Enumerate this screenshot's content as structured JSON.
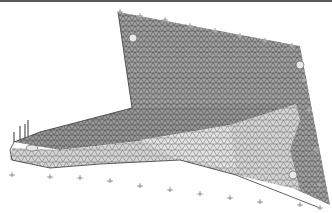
{
  "figure": {
    "title": "Finite element triangular mesh of bracket with boundary constraints",
    "background": "#ffffff",
    "border_color": "#5a5a5a",
    "mesh": {
      "element_type": "triangle",
      "line_color": "#3c3c3c",
      "face_color_dark": "#9a9a9a",
      "face_color_light": "#d8d8d8"
    },
    "parts": [
      {
        "name": "back-plate",
        "points": "118,12 300,46 330,205 236,160 132,110"
      },
      {
        "name": "horizontal-flange",
        "points": "132,110 236,160 300,185 170,170 60,150 10,150 12,135"
      },
      {
        "name": "gusset",
        "points": "12,135 132,110 290,95 300,120 180,160 60,170 10,160"
      }
    ],
    "holes": [
      {
        "name": "hole-top-left",
        "cx": 133,
        "cy": 38,
        "r": 4
      },
      {
        "name": "hole-top-right",
        "cx": 300,
        "cy": 65,
        "r": 4
      },
      {
        "name": "hole-bottom-right",
        "cx": 293,
        "cy": 175,
        "r": 4
      },
      {
        "name": "hole-tip",
        "cx": 32,
        "cy": 153,
        "r": 4
      }
    ],
    "constraints": {
      "color": "#a8a8a8",
      "markers": [
        [
          120,
          12
        ],
        [
          140,
          16
        ],
        [
          165,
          20
        ],
        [
          190,
          26
        ],
        [
          215,
          31
        ],
        [
          240,
          36
        ],
        [
          265,
          41
        ],
        [
          292,
          46
        ],
        [
          304,
          80
        ],
        [
          309,
          110
        ],
        [
          316,
          150
        ],
        [
          320,
          185
        ],
        [
          12,
          175
        ],
        [
          50,
          177
        ],
        [
          80,
          178
        ],
        [
          110,
          181
        ],
        [
          140,
          186
        ],
        [
          170,
          190
        ],
        [
          200,
          194
        ],
        [
          230,
          198
        ],
        [
          260,
          202
        ],
        [
          300,
          205
        ],
        [
          320,
          208
        ]
      ]
    },
    "load_arrows": {
      "color": "#555555",
      "arrows": [
        [
          14,
          140,
          14,
          132
        ],
        [
          20,
          138,
          20,
          126
        ],
        [
          25,
          136,
          25,
          124
        ],
        [
          28,
          134,
          28,
          120
        ]
      ]
    }
  }
}
